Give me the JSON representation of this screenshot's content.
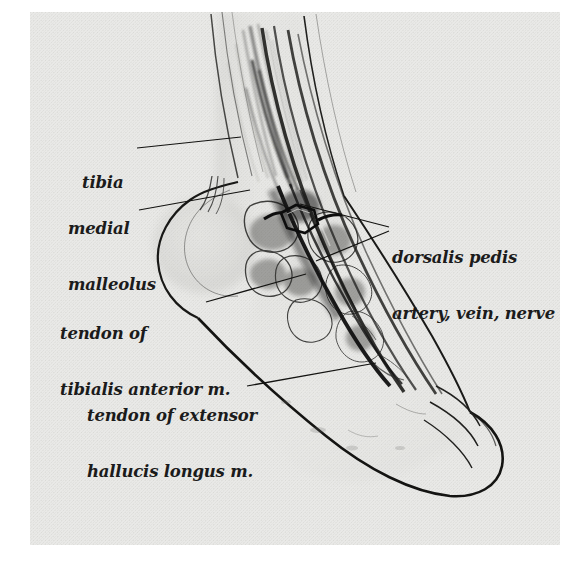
{
  "plate": {
    "kind": "anatomical-illustration",
    "subject": "medial view dissection of the right ankle and foot",
    "background_color": "#e9e9e7",
    "paper_color": "#ffffff",
    "ink_color": "#1b1b1b",
    "plate_bounds": {
      "x": 30,
      "y": 12,
      "width": 530,
      "height": 533
    }
  },
  "labels": [
    {
      "id": "tibia",
      "lines": [
        "tibia"
      ],
      "text": "tibia",
      "x": 82,
      "y": 136,
      "leader": {
        "x1": 137,
        "y1": 148,
        "x2": 241,
        "y2": 137
      }
    },
    {
      "id": "medial-malleolus",
      "lines": [
        "medial",
        "malleolus"
      ],
      "text": "medial malleolus",
      "x": 68,
      "y": 182,
      "leader": {
        "x1": 139,
        "y1": 210,
        "x2": 250,
        "y2": 190
      }
    },
    {
      "id": "dorsalis-pedis",
      "lines": [
        "dorsalis pedis",
        "artery, vein, nerve"
      ],
      "text": "dorsalis pedis artery, vein, nerve",
      "x": 392,
      "y": 211,
      "leader": {
        "x1": 389,
        "y1": 227,
        "x2": 300,
        "y2": 204
      },
      "leader2": {
        "x1": 389,
        "y1": 231,
        "x2": 316,
        "y2": 261
      }
    },
    {
      "id": "tendon-tibialis-anterior",
      "lines": [
        "tendon of",
        "tibialis anterior m."
      ],
      "text": "tendon of tibialis anterior m.",
      "x": 60,
      "y": 287,
      "leader": {
        "x1": 206,
        "y1": 302,
        "x2": 306,
        "y2": 274
      }
    },
    {
      "id": "tendon-extensor-hallucis-longus",
      "lines": [
        "tendon of extensor",
        "hallucis longus m."
      ],
      "text": "tendon of extensor hallucis longus m.",
      "x": 87,
      "y": 369,
      "leader": {
        "x1": 247,
        "y1": 386,
        "x2": 376,
        "y2": 363
      }
    }
  ],
  "structures": [
    {
      "name": "tibia-shaft"
    },
    {
      "name": "medial-malleolus-prominence"
    },
    {
      "name": "tendon-tibialis-anterior"
    },
    {
      "name": "tendon-extensor-hallucis-longus"
    },
    {
      "name": "dorsalis-pedis-neurovascular-bundle"
    },
    {
      "name": "retractor-loop"
    },
    {
      "name": "tarsal-bones"
    },
    {
      "name": "foot-outline"
    },
    {
      "name": "toes"
    }
  ]
}
